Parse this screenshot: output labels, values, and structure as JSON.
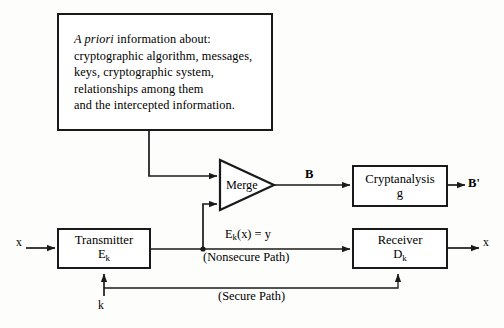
{
  "diagram": {
    "info_box": {
      "lines": [
        {
          "italic": "A priori",
          "rest": " information about:"
        },
        {
          "italic": "",
          "rest": "cryptographic algorithm, messages,"
        },
        {
          "italic": "",
          "rest": "keys, cryptographic system,"
        },
        {
          "italic": "",
          "rest": "relationships among them"
        },
        {
          "italic": "",
          "rest": "and the intercepted information."
        }
      ]
    },
    "nodes": {
      "merge": {
        "label": "Merge"
      },
      "cryptanalysis": {
        "line1": "Cryptanalysis",
        "line2": "g"
      },
      "transmitter": {
        "line1": "Transmitter",
        "line2_base": "E",
        "line2_sub": "k"
      },
      "receiver": {
        "line1": "Receiver",
        "line2_base": "D",
        "line2_sub": "k"
      }
    },
    "labels": {
      "merge_output": "B",
      "cryptanalysis_output_base": "B",
      "cryptanalysis_output_prime": "'",
      "plaintext_in": "x",
      "plaintext_out": "x",
      "ciphertext_base": "E",
      "ciphertext_sub": "k",
      "ciphertext_rest": "(x) = y",
      "nonsecure_path": "(Nonsecure Path)",
      "secure_path": "(Secure Path)",
      "key": "k"
    },
    "colors": {
      "ink": "#1a1a1a",
      "background": "#fdfdfc",
      "box_fill": "#ffffff"
    }
  }
}
